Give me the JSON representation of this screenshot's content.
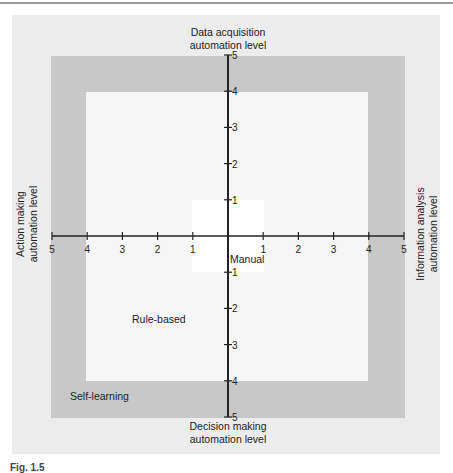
{
  "axes": {
    "top": {
      "label_line1": "Data acquisition",
      "label_line2": "automation level"
    },
    "bottom": {
      "label_line1": "Decision making",
      "label_line2": "automation level"
    },
    "left": {
      "label_line1": "Action making",
      "label_line2": "automation level"
    },
    "right": {
      "label_line1": "Information analysis",
      "label_line2": "automation level"
    },
    "ticks": [
      "1",
      "2",
      "3",
      "4",
      "5"
    ]
  },
  "regions": {
    "manual": {
      "label": "Manual",
      "level_max": 1
    },
    "rule_based": {
      "label": "Rule-based",
      "level_min": 1,
      "level_max": 4
    },
    "self_learning": {
      "label": "Self-learning",
      "level_min": 4,
      "level_max": 5
    }
  },
  "colors": {
    "outer_background": "#ececec",
    "self_learning_band": "#c8c8c8",
    "rule_based_area": "#f6f6f6",
    "manual_area": "#ffffff",
    "axis": "#222222"
  },
  "caption": "Fig. 1.5"
}
